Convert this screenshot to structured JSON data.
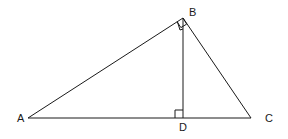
{
  "diagram": {
    "type": "right-triangle-with-altitude",
    "stroke_color": "#1a1a1a",
    "background": "#ffffff",
    "points": {
      "A": {
        "x": 28,
        "y": 118
      },
      "B": {
        "x": 183,
        "y": 18
      },
      "C": {
        "x": 251,
        "y": 118
      },
      "D": {
        "x": 183,
        "y": 118
      }
    },
    "labels": {
      "A": {
        "text": "A",
        "x": 17,
        "y": 122
      },
      "B": {
        "text": "B",
        "x": 189,
        "y": 16
      },
      "C": {
        "text": "C",
        "x": 265,
        "y": 122
      },
      "D": {
        "text": "D",
        "x": 179,
        "y": 131
      }
    },
    "segments": [
      {
        "from": "A",
        "to": "B"
      },
      {
        "from": "B",
        "to": "C"
      },
      {
        "from": "A",
        "to": "C"
      },
      {
        "from": "B",
        "to": "D"
      }
    ],
    "right_angles": [
      {
        "vertex": "B",
        "between": [
          "A",
          "C"
        ]
      },
      {
        "vertex": "D",
        "between": [
          "A",
          "B"
        ]
      }
    ]
  }
}
